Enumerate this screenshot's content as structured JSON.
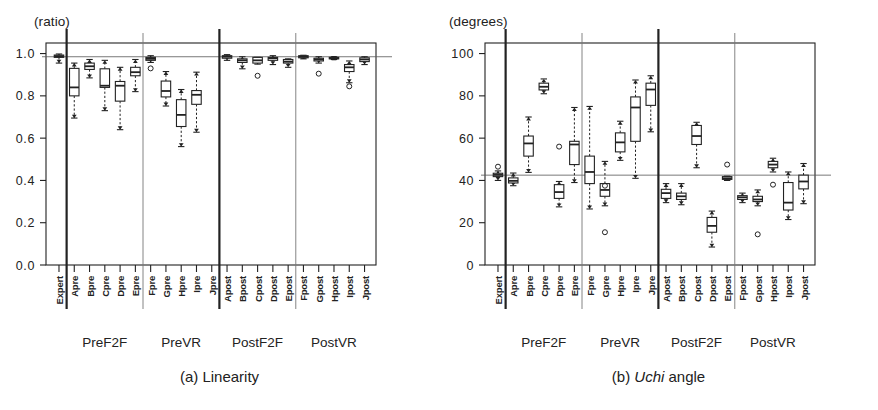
{
  "figure": {
    "panels": [
      {
        "id": "a",
        "caption_prefix": "(a) ",
        "caption_italic": "",
        "caption_rest": "Linearity",
        "unit_label": "(ratio)"
      },
      {
        "id": "b",
        "caption_prefix": "(b) ",
        "caption_italic": "Uchi",
        "caption_rest": " angle",
        "unit_label": "(degrees)"
      }
    ],
    "group_labels": [
      "PreF2F",
      "PreVR",
      "PostF2F",
      "PostVR"
    ],
    "categories": [
      "Expert",
      "Apre",
      "Bpre",
      "Cpre",
      "Dpre",
      "Epre",
      "Fpre",
      "Gpre",
      "Hpre",
      "Ipre",
      "Jpre",
      "Apost",
      "Bpost",
      "Cpost",
      "Dpost",
      "Epost",
      "Fpost",
      "Gpost",
      "Hpost",
      "Ipost",
      "Jpost"
    ]
  },
  "chart_data": [
    {
      "type": "box",
      "panel": "a",
      "title": "(a) Linearity",
      "ylabel": "(ratio)",
      "xlabel": "",
      "ylim": [
        0.0,
        1.05
      ],
      "yticks": [
        "0.0",
        "0.2",
        "0.4",
        "0.6",
        "0.8",
        "1.0"
      ],
      "ytickvalues": [
        0.0,
        0.2,
        0.4,
        0.6,
        0.8,
        1.0
      ],
      "grid": false,
      "reference_line": 0.985,
      "categories": [
        "Expert",
        "Apre",
        "Bpre",
        "Cpre",
        "Dpre",
        "Epre",
        "Fpre",
        "Gpre",
        "Hpre",
        "Ipre",
        "Jpre",
        "Apost",
        "Bpost",
        "Cpost",
        "Dpost",
        "Epost",
        "Fpost",
        "Gpost",
        "Hpost",
        "Ipost",
        "Jpost"
      ],
      "boxes": [
        {
          "cat": "Expert",
          "whisker_low": 0.955,
          "q1": 0.982,
          "median": 0.988,
          "q3": 0.993,
          "whisker_high": 0.998,
          "outliers": []
        },
        {
          "cat": "Apre",
          "whisker_low": 0.695,
          "q1": 0.8,
          "median": 0.84,
          "q3": 0.93,
          "whisker_high": 0.955,
          "outliers": []
        },
        {
          "cat": "Bpre",
          "whisker_low": 0.885,
          "q1": 0.925,
          "median": 0.94,
          "q3": 0.955,
          "whisker_high": 0.972,
          "outliers": []
        },
        {
          "cat": "Cpre",
          "whisker_low": 0.73,
          "q1": 0.84,
          "median": 0.848,
          "q3": 0.928,
          "whisker_high": 0.968,
          "outliers": []
        },
        {
          "cat": "Dpre",
          "whisker_low": 0.64,
          "q1": 0.775,
          "median": 0.848,
          "q3": 0.868,
          "whisker_high": 0.935,
          "outliers": []
        },
        {
          "cat": "Epre",
          "whisker_low": 0.82,
          "q1": 0.895,
          "median": 0.912,
          "q3": 0.935,
          "whisker_high": 0.972,
          "outliers": []
        },
        {
          "cat": "Fpre",
          "whisker_low": 0.958,
          "q1": 0.968,
          "median": 0.975,
          "q3": 0.982,
          "whisker_high": 0.99,
          "outliers": [
            0.93
          ]
        },
        {
          "cat": "Gpre",
          "whisker_low": 0.752,
          "q1": 0.795,
          "median": 0.823,
          "q3": 0.87,
          "whisker_high": 0.915,
          "outliers": []
        },
        {
          "cat": "Hpre",
          "whisker_low": 0.56,
          "q1": 0.655,
          "median": 0.71,
          "q3": 0.782,
          "whisker_high": 0.83,
          "outliers": []
        },
        {
          "cat": "Ipre",
          "whisker_low": 0.628,
          "q1": 0.76,
          "median": 0.805,
          "q3": 0.825,
          "whisker_high": 0.912,
          "outliers": []
        },
        {
          "cat": "Apost",
          "whisker_low": 0.968,
          "q1": 0.978,
          "median": 0.985,
          "q3": 0.99,
          "whisker_high": 0.995,
          "outliers": []
        },
        {
          "cat": "Bpost",
          "whisker_low": 0.928,
          "q1": 0.958,
          "median": 0.968,
          "q3": 0.975,
          "whisker_high": 0.985,
          "outliers": []
        },
        {
          "cat": "Cpost",
          "whisker_low": 0.95,
          "q1": 0.955,
          "median": 0.968,
          "q3": 0.982,
          "whisker_high": 0.982,
          "outliers": [
            0.895
          ]
        },
        {
          "cat": "Dpost",
          "whisker_low": 0.948,
          "q1": 0.968,
          "median": 0.978,
          "q3": 0.982,
          "whisker_high": 0.99,
          "outliers": []
        },
        {
          "cat": "Epost",
          "whisker_low": 0.935,
          "q1": 0.955,
          "median": 0.962,
          "q3": 0.972,
          "whisker_high": 0.975,
          "outliers": []
        },
        {
          "cat": "Fpost",
          "whisker_low": 0.975,
          "q1": 0.98,
          "median": 0.985,
          "q3": 0.99,
          "whisker_high": 0.992,
          "outliers": []
        },
        {
          "cat": "Gpost",
          "whisker_low": 0.955,
          "q1": 0.965,
          "median": 0.972,
          "q3": 0.978,
          "whisker_high": 0.985,
          "outliers": [
            0.905
          ]
        },
        {
          "cat": "Hpost",
          "whisker_low": 0.972,
          "q1": 0.975,
          "median": 0.978,
          "q3": 0.982,
          "whisker_high": 0.985,
          "outliers": []
        },
        {
          "cat": "Ipost",
          "whisker_low": 0.862,
          "q1": 0.915,
          "median": 0.935,
          "q3": 0.948,
          "whisker_high": 0.965,
          "outliers": [
            0.845
          ]
        },
        {
          "cat": "Jpost",
          "whisker_low": 0.948,
          "q1": 0.962,
          "median": 0.972,
          "q3": 0.98,
          "whisker_high": 0.985,
          "outliers": []
        }
      ]
    },
    {
      "type": "box",
      "panel": "b",
      "title": "(b) Uchi angle",
      "ylabel": "(degrees)",
      "xlabel": "",
      "ylim": [
        0,
        105
      ],
      "yticks": [
        "0",
        "20",
        "40",
        "60",
        "80",
        "100"
      ],
      "ytickvalues": [
        0,
        20,
        40,
        60,
        80,
        100
      ],
      "grid": false,
      "reference_line": 42.5,
      "categories": [
        "Expert",
        "Apre",
        "Bpre",
        "Cpre",
        "Dpre",
        "Epre",
        "Fpre",
        "Gpre",
        "Hpre",
        "Ipre",
        "Jpre",
        "Apost",
        "Bpost",
        "Cpost",
        "Dpost",
        "Epost",
        "Fpost",
        "Gpost",
        "Hpost",
        "Ipost",
        "Jpost"
      ],
      "boxes": [
        {
          "cat": "Expert",
          "whisker_low": 40.0,
          "q1": 41.8,
          "median": 42.6,
          "q3": 43.4,
          "whisker_high": 44.5,
          "outliers": [
            46.5
          ]
        },
        {
          "cat": "Apre",
          "whisker_low": 37.5,
          "q1": 38.8,
          "median": 39.8,
          "q3": 41.2,
          "whisker_high": 43.5,
          "outliers": []
        },
        {
          "cat": "Bpre",
          "whisker_low": 43.8,
          "q1": 51.5,
          "median": 57.5,
          "q3": 61.0,
          "whisker_high": 70.0,
          "outliers": []
        },
        {
          "cat": "Cpre",
          "whisker_low": 81.0,
          "q1": 82.8,
          "median": 84.3,
          "q3": 86.0,
          "whisker_high": 88.0,
          "outliers": []
        },
        {
          "cat": "Dpre",
          "whisker_low": 27.5,
          "q1": 31.5,
          "median": 34.5,
          "q3": 38.0,
          "whisker_high": 39.5,
          "outliers": [
            56.0
          ]
        },
        {
          "cat": "Epre",
          "whisker_low": 39.0,
          "q1": 47.5,
          "median": 57.0,
          "q3": 58.5,
          "whisker_high": 74.5,
          "outliers": []
        },
        {
          "cat": "Fpre",
          "whisker_low": 26.5,
          "q1": 38.5,
          "median": 44.0,
          "q3": 51.5,
          "whisker_high": 75.0,
          "outliers": []
        },
        {
          "cat": "Gpre",
          "whisker_low": 28.0,
          "q1": 32.5,
          "median": 35.5,
          "q3": 38.5,
          "whisker_high": 49.0,
          "outliers": [
            15.5,
            37.5
          ]
        },
        {
          "cat": "Hpre",
          "whisker_low": 49.5,
          "q1": 53.5,
          "median": 58.0,
          "q3": 62.5,
          "whisker_high": 68.0,
          "outliers": []
        },
        {
          "cat": "Ipre",
          "whisker_low": 41.0,
          "q1": 58.5,
          "median": 74.5,
          "q3": 79.5,
          "whisker_high": 87.5,
          "outliers": []
        },
        {
          "cat": "Jpre",
          "whisker_low": 63.0,
          "q1": 75.5,
          "median": 83.0,
          "q3": 86.0,
          "whisker_high": 89.5,
          "outliers": []
        },
        {
          "cat": "Apost",
          "whisker_low": 29.5,
          "q1": 31.5,
          "median": 34.0,
          "q3": 35.8,
          "whisker_high": 38.5,
          "outliers": []
        },
        {
          "cat": "Bpost",
          "whisker_low": 28.5,
          "q1": 31.0,
          "median": 32.5,
          "q3": 34.0,
          "whisker_high": 38.5,
          "outliers": []
        },
        {
          "cat": "Cpost",
          "whisker_low": 46.0,
          "q1": 57.0,
          "median": 61.0,
          "q3": 66.0,
          "whisker_high": 67.5,
          "outliers": []
        },
        {
          "cat": "Dpost",
          "whisker_low": 8.5,
          "q1": 15.5,
          "median": 18.5,
          "q3": 22.5,
          "whisker_high": 25.5,
          "outliers": []
        },
        {
          "cat": "Epost",
          "whisker_low": 40.0,
          "q1": 40.5,
          "median": 41.0,
          "q3": 41.8,
          "whisker_high": 42.0,
          "outliers": [
            47.5
          ]
        },
        {
          "cat": "Fpost",
          "whisker_low": 29.5,
          "q1": 31.0,
          "median": 32.0,
          "q3": 32.8,
          "whisker_high": 34.0,
          "outliers": []
        },
        {
          "cat": "Gpost",
          "whisker_low": 28.0,
          "q1": 30.0,
          "median": 31.0,
          "q3": 32.5,
          "whisker_high": 35.5,
          "outliers": [
            14.5
          ]
        },
        {
          "cat": "Hpost",
          "whisker_low": 44.0,
          "q1": 46.0,
          "median": 47.5,
          "q3": 49.0,
          "whisker_high": 50.5,
          "outliers": [
            38.0
          ]
        },
        {
          "cat": "Ipost",
          "whisker_low": 21.5,
          "q1": 26.0,
          "median": 29.5,
          "q3": 39.0,
          "whisker_high": 44.0,
          "outliers": []
        },
        {
          "cat": "Jpost",
          "whisker_low": 29.0,
          "q1": 36.0,
          "median": 39.5,
          "q3": 42.5,
          "whisker_high": 48.0,
          "outliers": []
        }
      ]
    }
  ]
}
